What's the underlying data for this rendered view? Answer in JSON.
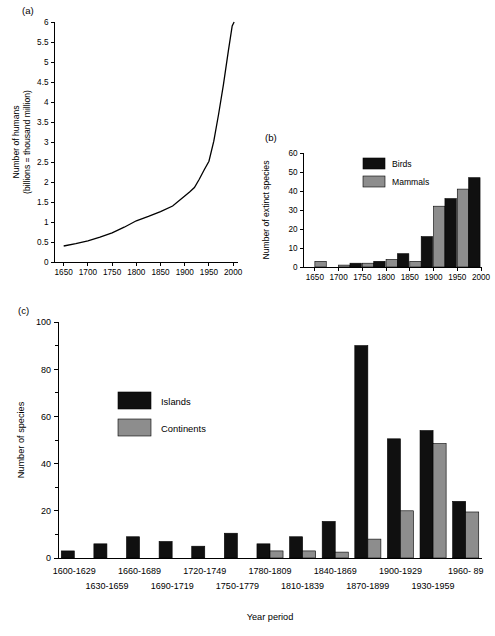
{
  "figure": {
    "panels": [
      {
        "id": "a",
        "label": "(a)"
      },
      {
        "id": "b",
        "label": "(b)"
      },
      {
        "id": "c",
        "label": "(c)"
      }
    ]
  },
  "chart_data": [
    {
      "type": "line",
      "panel": "(a)",
      "title": "",
      "xlabel": "",
      "ylabel": "Number of humans\n(billions = thousand million)",
      "ylabel_line1": "Number of humans",
      "ylabel_line2": "(billions = thousand million)",
      "xlim": [
        1630,
        2010
      ],
      "ylim": [
        0,
        6
      ],
      "xticks": [
        1650,
        1700,
        1750,
        1800,
        1850,
        1900,
        1950,
        2000
      ],
      "xticklabels": [
        "1650",
        "1700",
        "1750",
        "1800",
        "1850",
        "1900",
        "1950",
        "2000"
      ],
      "yticks": [
        0,
        0.5,
        1,
        1.5,
        2,
        2.5,
        3,
        3.5,
        4,
        4.5,
        5,
        5.5,
        6
      ],
      "yticklabels": [
        "0",
        "0.5",
        "1",
        "1.5",
        "2",
        "2.5",
        "3",
        "3.5",
        "4",
        "4.5",
        "5",
        "5.5",
        "6"
      ],
      "grid": false,
      "legend": null,
      "series": [
        {
          "name": "World human population",
          "x": [
            1650,
            1675,
            1700,
            1725,
            1750,
            1775,
            1800,
            1825,
            1850,
            1875,
            1900,
            1910,
            1920,
            1930,
            1940,
            1950,
            1960,
            1970,
            1980,
            1990,
            1998,
            2002
          ],
          "y": [
            0.4,
            0.46,
            0.53,
            0.62,
            0.73,
            0.87,
            1.03,
            1.14,
            1.26,
            1.4,
            1.65,
            1.75,
            1.86,
            2.07,
            2.3,
            2.52,
            3.02,
            3.7,
            4.44,
            5.27,
            5.9,
            6.0
          ]
        }
      ]
    },
    {
      "type": "bar",
      "panel": "(b)",
      "title": "",
      "xlabel": "",
      "ylabel": "Number of extinct species",
      "xlim": [
        1625,
        2000
      ],
      "ylim": [
        0,
        60
      ],
      "xticks": [
        1650,
        1700,
        1750,
        1800,
        1850,
        1900,
        1950,
        2000
      ],
      "xticklabels": [
        "1650",
        "1700",
        "1750",
        "1800",
        "1850",
        "1900",
        "1950",
        "2000"
      ],
      "yticks": [
        0,
        10,
        20,
        30,
        40,
        50,
        60
      ],
      "yticklabels": [
        "0",
        "10",
        "20",
        "30",
        "40",
        "50",
        "60"
      ],
      "grid": false,
      "legend": {
        "position": "upper-left",
        "entries": [
          "Birds",
          "Mammals"
        ]
      },
      "categories": [
        "1650",
        "1700",
        "1750",
        "1800",
        "1850",
        "1900",
        "1950"
      ],
      "series": [
        {
          "name": "Birds",
          "color": "#101010",
          "values": [
            0,
            2,
            3,
            7,
            16,
            36,
            47
          ]
        },
        {
          "name": "Mammals",
          "color": "#8d8d8d",
          "values": [
            3,
            1,
            2,
            4,
            3,
            32,
            41
          ]
        }
      ]
    },
    {
      "type": "bar",
      "panel": "(c)",
      "title": "",
      "xlabel": "Year period",
      "ylabel": "Number of species",
      "ylim": [
        0,
        100
      ],
      "yticks": [
        0,
        20,
        40,
        60,
        80,
        100
      ],
      "yticklabels": [
        "0",
        "20",
        "40",
        "60",
        "80",
        "100"
      ],
      "yminorticks": [
        10,
        30,
        50,
        70,
        90
      ],
      "grid": false,
      "legend": {
        "position": "upper-left",
        "entries": [
          "Islands",
          "Continents"
        ]
      },
      "categories": [
        "1600-1629",
        "1630-1659",
        "1660-1689",
        "1690-1719",
        "1720-1749",
        "1750-1779",
        "1780-1809",
        "1810-1839",
        "1840-1869",
        "1870-1899",
        "1900-1929",
        "1930-1959",
        "1960- 89"
      ],
      "series": [
        {
          "name": "Islands",
          "color": "#101010",
          "values": [
            3,
            6,
            9,
            7,
            5,
            10.5,
            6,
            9,
            15.5,
            90,
            50.5,
            54,
            24
          ]
        },
        {
          "name": "Continents",
          "color": "#8d8d8d",
          "values": [
            0,
            0,
            0,
            0,
            0,
            0,
            3,
            3,
            2.5,
            8,
            20,
            48.5,
            19.5
          ]
        }
      ]
    }
  ],
  "colors": {
    "series_dark": "#101010",
    "series_gray": "#8d8d8d",
    "axis": "#000000",
    "background": "#ffffff"
  }
}
